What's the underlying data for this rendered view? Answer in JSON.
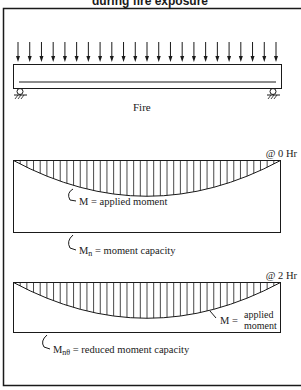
{
  "title": "during fire exposure",
  "beam": {
    "label": "Fire",
    "load_arrow_count": 23,
    "supports": [
      "pin-left",
      "roller-right"
    ]
  },
  "diagrams": [
    {
      "time_label": "@ 0 Hr",
      "applied_label": "M = applied moment",
      "capacity_label_main": "M",
      "capacity_label_sub": "n",
      "capacity_label_rest": " = moment capacity"
    },
    {
      "time_label": "@ 2 Hr",
      "applied_label_prefix": "M =",
      "applied_label_line1": "applied",
      "applied_label_line2": "moment",
      "capacity_label_main": "M",
      "capacity_label_sub": "nθ",
      "capacity_label_rest": " = reduced moment capacity"
    }
  ],
  "colors": {
    "line": "#1a1a1a",
    "background": "#ffffff"
  }
}
